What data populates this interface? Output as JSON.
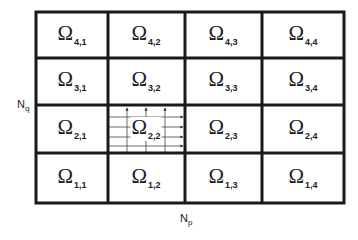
{
  "diagram": {
    "rows": 4,
    "cols": 4,
    "symbol": "Ω",
    "axis_labels": {
      "vertical": {
        "main": "N",
        "sub": "q"
      },
      "horizontal": {
        "main": "N",
        "sub": "p"
      }
    },
    "cells": [
      {
        "row": 4,
        "col": 1,
        "sub": "4,1"
      },
      {
        "row": 4,
        "col": 2,
        "sub": "4,2"
      },
      {
        "row": 4,
        "col": 3,
        "sub": "4,3"
      },
      {
        "row": 4,
        "col": 4,
        "sub": "4,4"
      },
      {
        "row": 3,
        "col": 1,
        "sub": "3,1"
      },
      {
        "row": 3,
        "col": 2,
        "sub": "3,2"
      },
      {
        "row": 3,
        "col": 3,
        "sub": "3,3"
      },
      {
        "row": 3,
        "col": 4,
        "sub": "3,4"
      },
      {
        "row": 2,
        "col": 1,
        "sub": "2,1"
      },
      {
        "row": 2,
        "col": 2,
        "sub": "2,2",
        "refined": true
      },
      {
        "row": 2,
        "col": 3,
        "sub": "2,3"
      },
      {
        "row": 2,
        "col": 4,
        "sub": "2,4"
      },
      {
        "row": 1,
        "col": 1,
        "sub": "1,1"
      },
      {
        "row": 1,
        "col": 2,
        "sub": "1,2"
      },
      {
        "row": 1,
        "col": 3,
        "sub": "1,3"
      },
      {
        "row": 1,
        "col": 4,
        "sub": "1,4"
      }
    ],
    "refined_cell": {
      "cell": "2,2",
      "vertical_lines_with_up_arrows": 3,
      "horizontal_lines_with_right_arrows": 4
    },
    "colors": {
      "lines": "#1a1a1a",
      "fine_lines": "#333333",
      "background": "#ffffff"
    }
  }
}
